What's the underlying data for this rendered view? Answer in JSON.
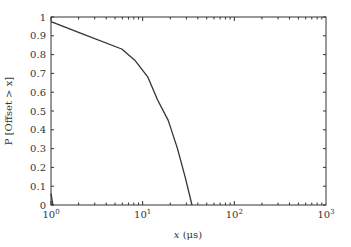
{
  "chart_data": {
    "type": "line",
    "title": "",
    "xlabel": "x (μs)",
    "ylabel": "P [Offset > x]",
    "xscale": "log",
    "xlim": [
      1,
      1000
    ],
    "ylim": [
      0,
      1
    ],
    "grid": false,
    "legend": null,
    "xticks": [
      {
        "value": 1,
        "base": "10",
        "exp": "0"
      },
      {
        "value": 10,
        "base": "10",
        "exp": "1"
      },
      {
        "value": 100,
        "base": "10",
        "exp": "2"
      },
      {
        "value": 1000,
        "base": "10",
        "exp": "3"
      }
    ],
    "yticks": [
      "0",
      "0.1",
      "0.2",
      "0.3",
      "0.4",
      "0.5",
      "0.6",
      "0.7",
      "0.8",
      "0.9",
      "1"
    ],
    "series": [
      {
        "name": "P[Offset > x]",
        "color": "#333333",
        "x": [
          1,
          2.2,
          5.9,
          8.2,
          11.4,
          14.5,
          19,
          24,
          29,
          34.5
        ],
        "y": [
          0.975,
          0.91,
          0.83,
          0.77,
          0.68,
          0.56,
          0.45,
          0.3,
          0.15,
          0.0
        ]
      },
      {
        "name": "initial-drop",
        "color": "#333333",
        "x": [
          1,
          1.05
        ],
        "y": [
          0.06,
          0.0
        ]
      }
    ]
  },
  "labels": {
    "xlabel_var": "x",
    "xlabel_unit": " (μs)",
    "ylabel": "P [Offset > x]"
  }
}
